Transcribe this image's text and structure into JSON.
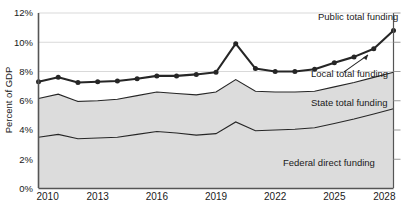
{
  "chart_data": {
    "type": "area",
    "title": "",
    "subtitle": "",
    "xlabel": "",
    "ylabel": "Percent of GDP",
    "xlim": [
      2010,
      2028
    ],
    "ylim": [
      0,
      12
    ],
    "ytick_labels": [
      "0%",
      "2%",
      "4%",
      "6%",
      "8%",
      "10%",
      "12%"
    ],
    "ytick_values": [
      0,
      2,
      4,
      6,
      8,
      10,
      12
    ],
    "xtick_labels": [
      "2010",
      "2013",
      "2016",
      "2019",
      "2022",
      "2025",
      "2028"
    ],
    "xtick_values": [
      2010,
      2013,
      2016,
      2019,
      2022,
      2025,
      2028
    ],
    "grid": "horizontal",
    "legend_position": "inline-annotations",
    "stacked": true,
    "x": [
      2010,
      2011,
      2012,
      2013,
      2014,
      2015,
      2016,
      2017,
      2018,
      2019,
      2020,
      2021,
      2022,
      2023,
      2024,
      2025,
      2026,
      2027,
      2028
    ],
    "series": [
      {
        "name": "Federal direct funding",
        "style": "thin-line-on-stack",
        "values": [
          3.5,
          3.7,
          3.4,
          3.45,
          3.5,
          3.7,
          3.9,
          3.8,
          3.65,
          3.75,
          4.55,
          3.95,
          4.0,
          4.05,
          4.15,
          4.45,
          4.75,
          5.1,
          5.45
        ]
      },
      {
        "name": "State total funding",
        "style": "thin-line-on-stack",
        "values": [
          2.65,
          2.75,
          2.55,
          2.55,
          2.6,
          2.65,
          2.7,
          2.7,
          2.75,
          2.85,
          2.9,
          2.7,
          2.6,
          2.55,
          2.5,
          2.5,
          2.5,
          2.5,
          2.5
        ]
      },
      {
        "name": "Local total funding",
        "style": "unfilled-gap",
        "values": [
          1.15,
          1.15,
          1.3,
          1.3,
          1.25,
          1.15,
          1.1,
          1.2,
          1.4,
          1.35,
          2.45,
          1.55,
          1.4,
          1.4,
          1.5,
          1.65,
          1.75,
          1.95,
          2.85
        ]
      }
    ],
    "total_line": {
      "name": "Public total funding",
      "marker": "circle",
      "values": [
        7.3,
        7.6,
        7.25,
        7.3,
        7.35,
        7.5,
        7.7,
        7.7,
        7.8,
        7.95,
        9.9,
        8.2,
        8.0,
        8.0,
        8.15,
        8.6,
        9.0,
        9.55,
        10.8
      ]
    },
    "annotations": [
      {
        "name": "public-total-funding",
        "label": "Public total funding"
      },
      {
        "name": "local-total-funding",
        "label": "Local total funding"
      },
      {
        "name": "state-total-funding",
        "label": "State total funding"
      },
      {
        "name": "federal-direct-funding",
        "label": "Federal direct funding"
      }
    ],
    "colors": {
      "band_fill": "#dcdcdc",
      "line": "#262626",
      "grid": "#d9d9d9",
      "axis": "#555555",
      "background": "#ffffff"
    }
  }
}
